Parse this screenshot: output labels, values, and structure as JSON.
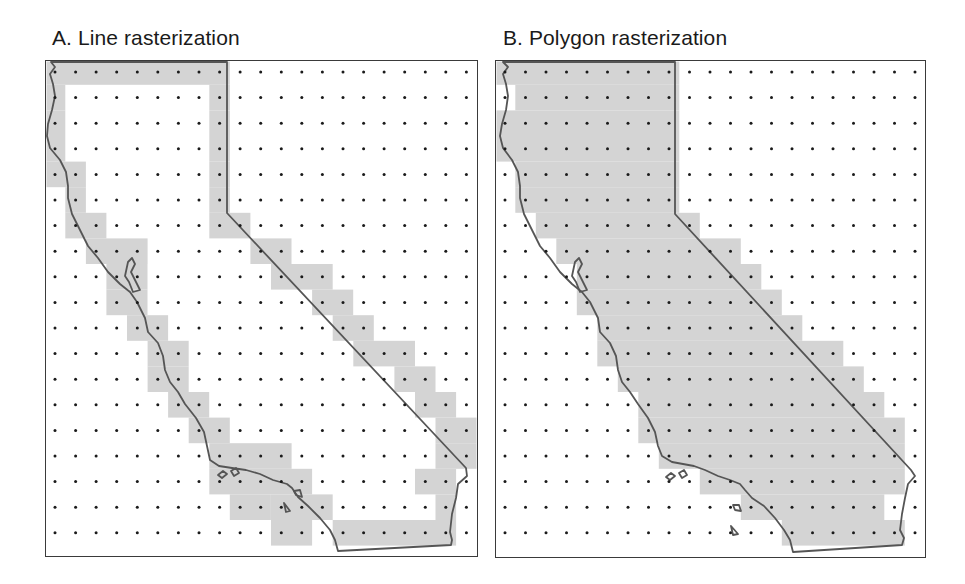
{
  "figure": {
    "panels": [
      {
        "id": "A",
        "title": "A. Line rasterization",
        "method": "line",
        "frame": {
          "x": 45,
          "y": 60,
          "w": 433,
          "h": 497
        },
        "grid": {
          "cols": 21,
          "rows": 19,
          "x0": 55,
          "y0": 72,
          "dx": 20.57,
          "dy": 25.6
        },
        "shaded_runs": [
          [
            [
              0,
              8
            ]
          ],
          [
            [
              0,
              0
            ],
            [
              8,
              8
            ]
          ],
          [
            [
              0,
              0
            ],
            [
              8,
              8
            ]
          ],
          [
            [
              0,
              0
            ],
            [
              8,
              8
            ]
          ],
          [
            [
              0,
              1
            ],
            [
              8,
              8
            ]
          ],
          [
            [
              1,
              1
            ],
            [
              8,
              8
            ]
          ],
          [
            [
              1,
              2
            ],
            [
              8,
              9
            ]
          ],
          [
            [
              2,
              4
            ],
            [
              10,
              11
            ]
          ],
          [
            [
              3,
              4
            ],
            [
              11,
              13
            ]
          ],
          [
            [
              3,
              4
            ],
            [
              13,
              14
            ]
          ],
          [
            [
              4,
              5
            ],
            [
              14,
              15
            ]
          ],
          [
            [
              5,
              6
            ],
            [
              15,
              17
            ]
          ],
          [
            [
              5,
              6
            ],
            [
              17,
              18
            ]
          ],
          [
            [
              6,
              7
            ],
            [
              18,
              19
            ]
          ],
          [
            [
              7,
              8
            ],
            [
              19,
              20
            ]
          ],
          [
            [
              8,
              11
            ],
            [
              19,
              20
            ]
          ],
          [
            [
              8,
              12
            ],
            [
              18,
              19
            ]
          ],
          [
            [
              9,
              10
            ],
            [
              11,
              13
            ],
            [
              19,
              19
            ]
          ],
          [
            [
              11,
              12
            ],
            [
              14,
              19
            ]
          ]
        ]
      },
      {
        "id": "B",
        "title": "B. Polygon rasterization",
        "method": "polygon",
        "frame": {
          "x": 495,
          "y": 60,
          "w": 431,
          "h": 498
        },
        "grid": {
          "cols": 21,
          "rows": 19,
          "x0": 505,
          "y0": 72,
          "dx": 20.5,
          "dy": 25.6
        },
        "shaded_runs": [
          [
            [
              0,
              8
            ]
          ],
          [
            [
              1,
              8
            ]
          ],
          [
            [
              0,
              8
            ]
          ],
          [
            [
              0,
              8
            ]
          ],
          [
            [
              1,
              8
            ]
          ],
          [
            [
              1,
              8
            ]
          ],
          [
            [
              2,
              9
            ]
          ],
          [
            [
              3,
              11
            ]
          ],
          [
            [
              4,
              12
            ]
          ],
          [
            [
              4,
              13
            ]
          ],
          [
            [
              5,
              14
            ]
          ],
          [
            [
              5,
              16
            ]
          ],
          [
            [
              6,
              17
            ]
          ],
          [
            [
              7,
              18
            ]
          ],
          [
            [
              7,
              19
            ]
          ],
          [
            [
              8,
              19
            ]
          ],
          [
            [
              10,
              19
            ]
          ],
          [
            [
              12,
              18
            ]
          ],
          [
            [
              14,
              19
            ]
          ]
        ]
      }
    ],
    "colors": {
      "shade": "#d4d4d4",
      "dot": "#1a1a1a",
      "outline": "#555555",
      "frame": "#3a3a3a"
    }
  }
}
